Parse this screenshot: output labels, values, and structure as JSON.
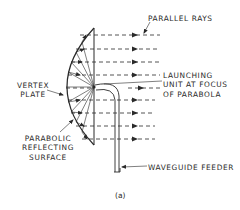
{
  "diagram": {
    "caption": "(a)",
    "labels": {
      "parallel_rays": "PARALLEL RAYS",
      "vertex_plate_line1": "VERTEX",
      "vertex_plate_line2": "PLATE",
      "launching_line1": "LAUNCHING",
      "launching_line2": "UNIT AT FOCUS",
      "launching_line3": "OF PARABOLA",
      "parabolic_line1": "PARABOLIC",
      "parabolic_line2": "REFLECTING",
      "parabolic_line3": "SURFACE",
      "waveguide_feeder": "WAVEGUIDE FEEDER"
    },
    "components": [
      "parabolic reflecting surface",
      "vertex plate",
      "launching unit at focus",
      "waveguide feeder",
      "parallel rays"
    ],
    "ray_count": 9,
    "colors": {
      "line": "#2a2a2a",
      "background": "#ffffff"
    }
  }
}
